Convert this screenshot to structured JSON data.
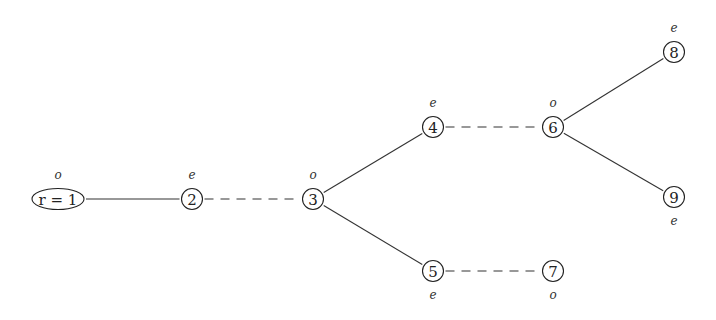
{
  "diagram": {
    "type": "tree",
    "nodes": [
      {
        "id": "1",
        "label": "r = 1",
        "parity": "o",
        "x": 58,
        "y": 199,
        "shape": "ellipse",
        "parity_pos": "above"
      },
      {
        "id": "2",
        "label": "2",
        "parity": "e",
        "x": 192,
        "y": 199,
        "shape": "circle",
        "parity_pos": "above"
      },
      {
        "id": "3",
        "label": "3",
        "parity": "o",
        "x": 313,
        "y": 199,
        "shape": "circle",
        "parity_pos": "above"
      },
      {
        "id": "4",
        "label": "4",
        "parity": "e",
        "x": 433,
        "y": 127,
        "shape": "circle",
        "parity_pos": "above"
      },
      {
        "id": "5",
        "label": "5",
        "parity": "e",
        "x": 433,
        "y": 271,
        "shape": "circle",
        "parity_pos": "below"
      },
      {
        "id": "6",
        "label": "6",
        "parity": "o",
        "x": 553,
        "y": 127,
        "shape": "circle",
        "parity_pos": "above"
      },
      {
        "id": "7",
        "label": "7",
        "parity": "o",
        "x": 553,
        "y": 271,
        "shape": "circle",
        "parity_pos": "below"
      },
      {
        "id": "8",
        "label": "8",
        "parity": "e",
        "x": 674,
        "y": 52,
        "shape": "circle",
        "parity_pos": "above"
      },
      {
        "id": "9",
        "label": "9",
        "parity": "e",
        "x": 674,
        "y": 197,
        "shape": "circle",
        "parity_pos": "below"
      }
    ],
    "edges": [
      {
        "from": "1",
        "to": "2",
        "style": "solid"
      },
      {
        "from": "2",
        "to": "3",
        "style": "dashed"
      },
      {
        "from": "3",
        "to": "4",
        "style": "solid"
      },
      {
        "from": "3",
        "to": "5",
        "style": "solid"
      },
      {
        "from": "4",
        "to": "6",
        "style": "dashed"
      },
      {
        "from": "5",
        "to": "7",
        "style": "dashed"
      },
      {
        "from": "6",
        "to": "8",
        "style": "solid"
      },
      {
        "from": "6",
        "to": "9",
        "style": "solid"
      }
    ],
    "colors": {
      "stroke": "#222222",
      "background": "#ffffff"
    }
  }
}
